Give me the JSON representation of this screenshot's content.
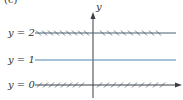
{
  "figure": {
    "panel_label": "(c)",
    "axis_label_y": "y",
    "lines": [
      {
        "label": "y = 2",
        "value": 2,
        "style": "hatched-back",
        "color": "#4a5f70"
      },
      {
        "label": "y = 1",
        "value": 1,
        "style": "solid",
        "color": "#4f86ad"
      },
      {
        "label": "y = 0",
        "value": 0,
        "style": "hatched-forward",
        "color": "#4a5f70"
      }
    ],
    "colors": {
      "axis": "#3a3f45",
      "text": "#333333"
    }
  }
}
